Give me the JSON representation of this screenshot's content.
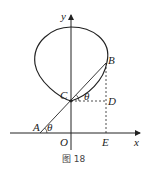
{
  "figure": {
    "caption": "图 18",
    "axes": {
      "x_label": "x",
      "y_label": "y",
      "origin_label": "O"
    },
    "points": {
      "A": "A",
      "B": "B",
      "C": "C",
      "D": "D",
      "E": "E"
    },
    "angles": {
      "at_A": "θ",
      "at_C": "θ"
    },
    "colors": {
      "stroke": "#222222",
      "background": "#ffffff"
    }
  }
}
